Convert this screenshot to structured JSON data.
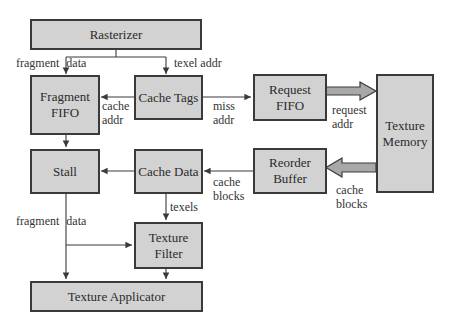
{
  "diagram": {
    "blocks": {
      "rasterizer": "Rasterizer",
      "fragment_fifo": "Fragment FIFO",
      "cache_tags": "Cache Tags",
      "request_fifo": "Request FIFO",
      "texture_memory": "Texture Memory",
      "stall": "Stall",
      "cache_data": "Cache Data",
      "reorder_buffer": "Reorder Buffer",
      "texture_filter": "Texture Filter",
      "texture_applicator": "Texture Applicator"
    },
    "edge_labels": {
      "fragment_data_top": "fragment data",
      "texel_addr": "texel addr",
      "cache_addr_1": "cache",
      "cache_addr_2": "addr",
      "miss_addr_1": "miss",
      "miss_addr_2": "addr",
      "request_addr_1": "request",
      "request_addr_2": "addr",
      "cache_blocks_mem_1": "cache",
      "cache_blocks_mem_2": "blocks",
      "cache_blocks_rb_1": "cache",
      "cache_blocks_rb_2": "blocks",
      "texels": "texels",
      "fragment_data_bottom": "fragment data"
    },
    "colors": {
      "box_fill": "#d2d2d2",
      "box_border": "#3a3a3a",
      "wide_arrow_fill": "#a8a8a8",
      "line": "#3a3a3a"
    }
  }
}
